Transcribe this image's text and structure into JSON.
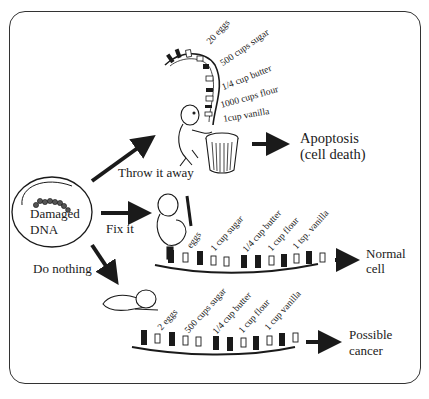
{
  "diagram": {
    "source": {
      "label_line1": "Damaged",
      "label_line2": "DNA"
    },
    "branches": [
      {
        "action": "Throw it away",
        "outcome_line1": "Apoptosis",
        "outcome_line2": "(cell death)",
        "ingredients": [
          "20 eggs",
          "500 cups sugar",
          "1/4 cup butter",
          "1000 cups flour",
          "1cup vanilla"
        ]
      },
      {
        "action": "Fix it",
        "outcome_line1": "Normal",
        "outcome_line2": "cell",
        "ingredients": [
          "eggs",
          "1 cup sugar",
          "1/4 cup butter",
          "1 cup flour",
          "1 tsp. vanilla"
        ]
      },
      {
        "action": "Do nothing",
        "outcome_line1": "Possible",
        "outcome_line2": "cancer",
        "ingredients": [
          "2 eggs",
          "500 cups sugar",
          "1/4 cup butter",
          "1 cup flour",
          "1 cup vanilla"
        ]
      }
    ],
    "icons": {
      "dna_blob": "damaged-dna-icon",
      "trash_can": "trash-can-icon",
      "worker_throwing": "worker-figure-icon",
      "worker_fixing": "worker-with-pencil-icon",
      "sleeping_figure": "sleeping-figure-icon",
      "arrow": "arrow-right-icon"
    },
    "colors": {
      "ink": "#1a1a1a",
      "frame": "#333333",
      "background": "#ffffff"
    }
  }
}
